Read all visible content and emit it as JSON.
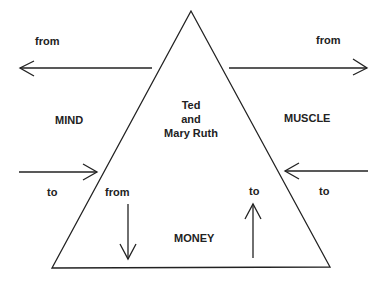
{
  "diagram": {
    "center": {
      "line1": "Ted",
      "line2": "and",
      "line3": "Mary Ruth"
    },
    "corners": {
      "left": "MIND",
      "right": "MUSCLE",
      "bottom": "MONEY"
    },
    "arrows": {
      "top_left": "from",
      "top_right": "from",
      "mid_left": "to",
      "mid_right": "to",
      "bottom_down": "from",
      "bottom_up": "to"
    },
    "line_color": "#222222"
  }
}
